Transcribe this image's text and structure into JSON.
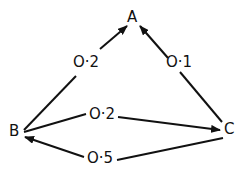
{
  "nodes": {
    "A": {
      "label": "A"
    },
    "B": {
      "label": "B"
    },
    "C": {
      "label": "C"
    }
  },
  "edges": [
    {
      "from": "B",
      "to": "A",
      "label": "O·2"
    },
    {
      "from": "C",
      "to": "A",
      "label": "O·1"
    },
    {
      "from": "B",
      "to": "C",
      "label": "O·2"
    },
    {
      "from": "C",
      "to": "B",
      "label": "O·5"
    }
  ],
  "colors": {
    "stroke": "#111111",
    "background": "#ffffff"
  }
}
